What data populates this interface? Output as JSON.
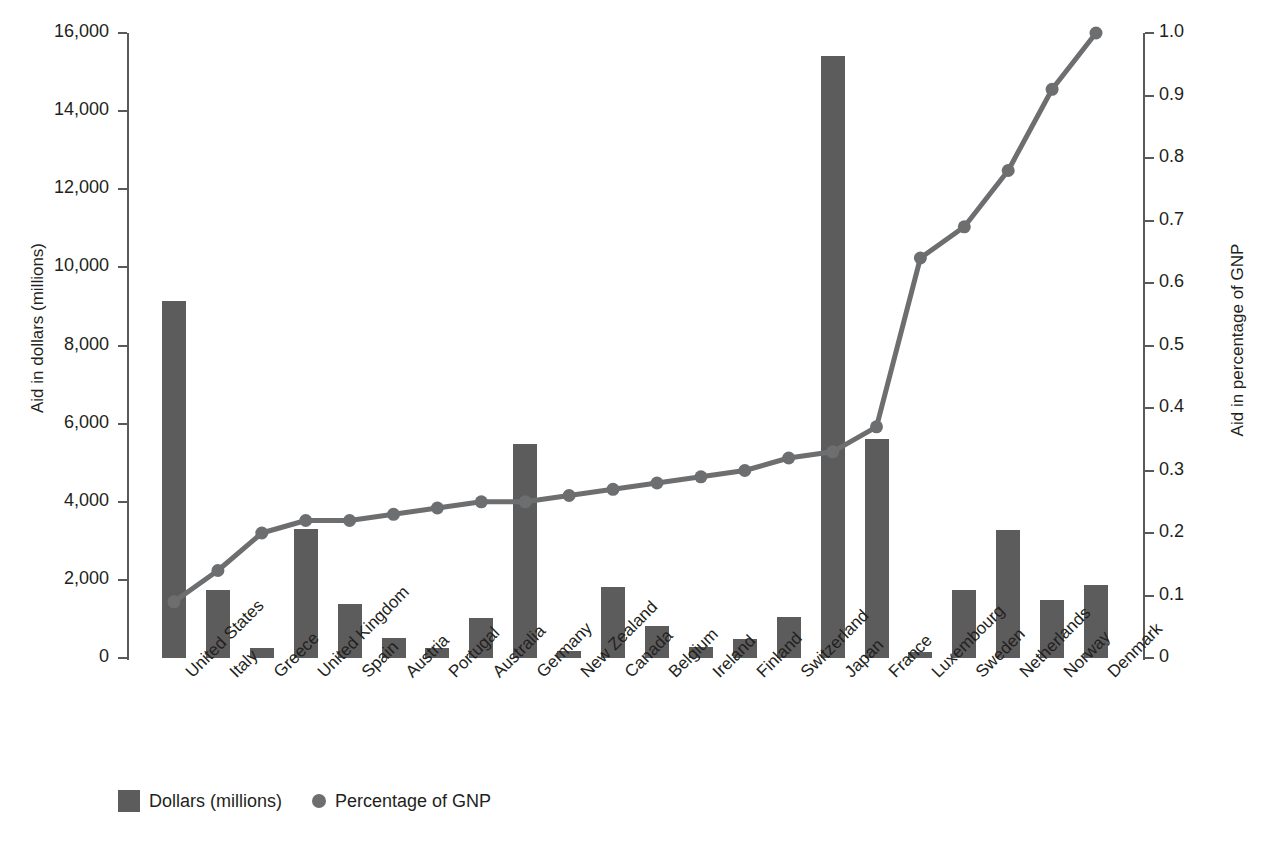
{
  "chart_data": {
    "type": "bar",
    "title": "",
    "categories": [
      "United States",
      "Italy",
      "Greece",
      "United Kingdom",
      "Spain",
      "Austria",
      "Portugal",
      "Australia",
      "Germany",
      "New Zealand",
      "Canada",
      "Belgium",
      "Ireland",
      "Finland",
      "Switzerland",
      "Japan",
      "France",
      "Luxembourg",
      "Sweden",
      "Netherlands",
      "Norway",
      "Denmark"
    ],
    "series": [
      {
        "name": "Dollars (millions)",
        "type": "bar",
        "axis": "left",
        "color": "#5c5c5c",
        "values": [
          9150,
          1750,
          250,
          3300,
          1380,
          500,
          260,
          1020,
          5480,
          170,
          1820,
          820,
          290,
          480,
          1040,
          15400,
          5600,
          160,
          1750,
          3280,
          1480,
          1860
        ]
      },
      {
        "name": "Percentage of GNP",
        "type": "line",
        "axis": "right",
        "color": "#6d6e70",
        "values": [
          0.09,
          0.14,
          0.2,
          0.22,
          0.22,
          0.23,
          0.24,
          0.25,
          0.25,
          0.26,
          0.27,
          0.28,
          0.29,
          0.3,
          0.32,
          0.33,
          0.37,
          0.64,
          0.69,
          0.78,
          0.91,
          1.0
        ]
      }
    ],
    "xlabel": "",
    "ylabel": "Aid in dollars (millions)",
    "y2label": "Aid in percentage of GNP",
    "ylim": [
      0,
      16000
    ],
    "y2lim": [
      0,
      1.0
    ],
    "yticks": [
      0,
      2000,
      4000,
      6000,
      8000,
      10000,
      12000,
      14000,
      16000
    ],
    "ytick_labels": [
      "0",
      "2,000",
      "4,000",
      "6,000",
      "8,000",
      "10,000",
      "12,000",
      "14,000",
      "16,000"
    ],
    "y2ticks": [
      0,
      0.1,
      0.2,
      0.3,
      0.4,
      0.5,
      0.6,
      0.7,
      0.8,
      0.9,
      1.0
    ],
    "y2tick_labels": [
      "0",
      "0.1",
      "0.2",
      "0.3",
      "0.4",
      "0.5",
      "0.6",
      "0.7",
      "0.8",
      "0.9",
      "1.0"
    ],
    "grid": false,
    "legend_position": "bottom-left",
    "legend": [
      {
        "label": "Dollars (millions)",
        "marker": "square",
        "color": "#5c5c5c"
      },
      {
        "label": "Percentage of GNP",
        "marker": "circle",
        "color": "#6d6e70"
      }
    ]
  },
  "axes": {
    "left_title": "Aid in dollars (millions)",
    "right_title": "Aid in percentage of GNP"
  },
  "legend": {
    "bars_label": "Dollars (millions)",
    "line_label": "Percentage of GNP"
  }
}
